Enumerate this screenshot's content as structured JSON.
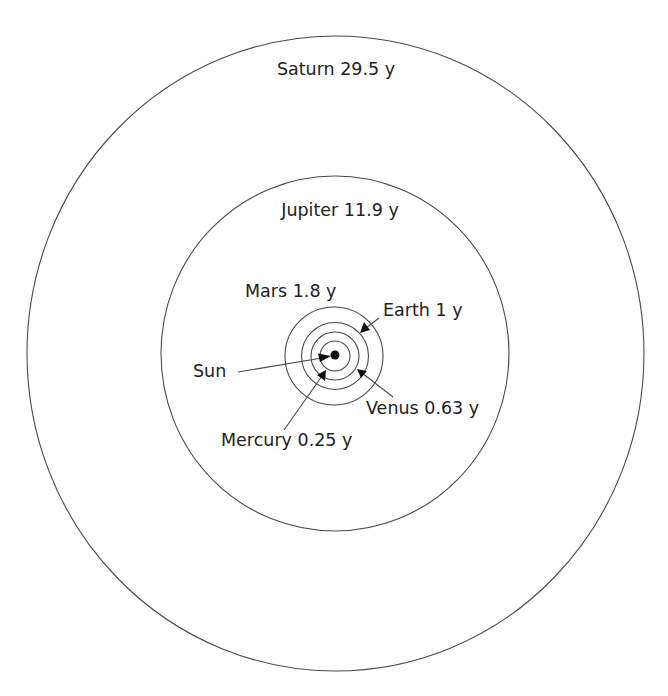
{
  "diagram": {
    "sun": {
      "label": "Sun"
    },
    "planets": [
      {
        "name": "Mercury",
        "period": "0.25 y",
        "label": "Mercury 0.25 y"
      },
      {
        "name": "Venus",
        "period": "0.63 y",
        "label": "Venus 0.63 y"
      },
      {
        "name": "Earth",
        "period": "1 y",
        "label": "Earth 1 y"
      },
      {
        "name": "Mars",
        "period": "1.8 y",
        "label": "Mars 1.8 y"
      },
      {
        "name": "Jupiter",
        "period": "11.9 y",
        "label": "Jupiter 11.9 y"
      },
      {
        "name": "Saturn",
        "period": "29.5 y",
        "label": "Saturn 29.5 y"
      }
    ],
    "colors": {
      "orbit": "#4a4a4a",
      "text": "#222222",
      "sun": "#111111",
      "background": "#ffffff"
    }
  }
}
